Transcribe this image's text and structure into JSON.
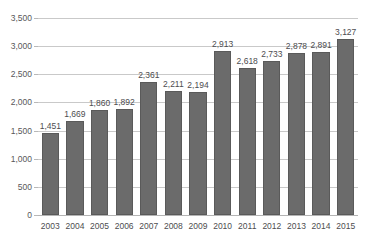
{
  "title_fragment": "",
  "chart_data": {
    "type": "bar",
    "title": "",
    "subtitle": "",
    "xlabel": "",
    "ylabel": "",
    "categories": [
      "2003",
      "2004",
      "2005",
      "2006",
      "2007",
      "2008",
      "2009",
      "2010",
      "2011",
      "2012",
      "2013",
      "2014",
      "2015"
    ],
    "values": [
      1451,
      1669,
      1860,
      1892,
      2361,
      2211,
      2194,
      2913,
      2618,
      2733,
      2878,
      2891,
      3127
    ],
    "value_labels": [
      "1,451",
      "1,669",
      "1,860",
      "1,892",
      "2,361",
      "2,211",
      "2,194",
      "2,913",
      "2,618",
      "2,733",
      "2,878",
      "2,891",
      "3,127"
    ],
    "series": [
      {
        "name": "",
        "values": [
          1451,
          1669,
          1860,
          1892,
          2361,
          2211,
          2194,
          2913,
          2618,
          2733,
          2878,
          2891,
          3127
        ]
      }
    ],
    "ylim": [
      0,
      3500
    ],
    "yticks": [
      0,
      500,
      1000,
      1500,
      2000,
      2500,
      3000,
      3500
    ],
    "ytick_labels": [
      "0",
      "500",
      "1,000",
      "1,500",
      "2,000",
      "2,500",
      "3,000",
      "3,500"
    ],
    "grid": true,
    "legend": false,
    "legend_position": "none",
    "bar_color": "#6b6b6b",
    "bar_edge_color": "#5a5a5a",
    "gridline_color": "#c9c9c9",
    "text_color": "#4d4d4f",
    "background_color": "#ffffff",
    "data_labels_shown": true
  }
}
